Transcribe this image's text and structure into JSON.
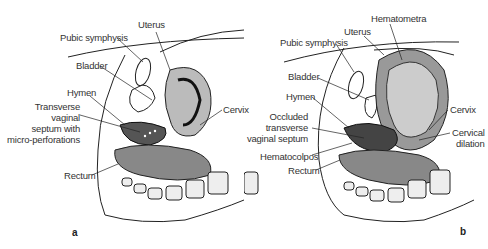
{
  "panels": [
    {
      "id": "a",
      "letter": "a",
      "labels": {
        "uterus": "Uterus",
        "pubic_symphysis": "Pubic symphysis",
        "bladder": "Bladder",
        "hymen": "Hymen",
        "septum_line1": "Transverse",
        "septum_line2": "vaginal",
        "septum_line3": "septum with",
        "septum_line4": "micro-perforations",
        "cervix": "Cervix",
        "rectum": "Rectum"
      }
    },
    {
      "id": "b",
      "letter": "b",
      "labels": {
        "hematometra": "Hematometra",
        "uterus": "Uterus",
        "pubic_symphysis": "Pubic symphysis",
        "bladder": "Bladder",
        "hymen": "Hymen",
        "septum_line1": "Occluded",
        "septum_line2": "transverse",
        "septum_line3": "vaginal septum",
        "cervix": "Cervix",
        "cervical_dilation_line1": "Cervical",
        "cervical_dilation_line2": "dilation",
        "hematocolpos": "Hematocolpos",
        "rectum": "Rectum"
      }
    }
  ]
}
